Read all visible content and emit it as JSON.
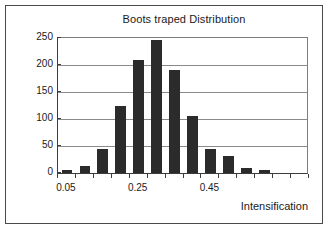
{
  "chart_data": {
    "type": "bar",
    "title": "Boots traped Distribution",
    "xlabel": "Intensification",
    "ylabel": "",
    "ylim": [
      0,
      250
    ],
    "xlim": [
      0.0,
      0.65
    ],
    "grid": true,
    "legend": null,
    "bin_width": 0.05,
    "categories": [
      "0.05",
      "0.10",
      "0.15",
      "0.20",
      "0.25",
      "0.30",
      "0.35",
      "0.40",
      "0.45",
      "0.50",
      "0.55",
      "0.60",
      "0.65",
      "0.70"
    ],
    "values": [
      5,
      13,
      45,
      125,
      210,
      247,
      190,
      105,
      45,
      31,
      10,
      5,
      0,
      0
    ],
    "y_ticks": [
      0,
      50,
      100,
      150,
      200,
      250
    ],
    "y_tick_labels": [
      "0",
      "50",
      "100",
      "150",
      "200",
      "250"
    ],
    "x_tick_labels": [
      "0.05",
      "0.25",
      "0.45"
    ],
    "bar_color": "#2b2b2b",
    "grid_color": "#8a8a8a",
    "axis_color": "#3c3c3c",
    "background": "#ffffff"
  }
}
